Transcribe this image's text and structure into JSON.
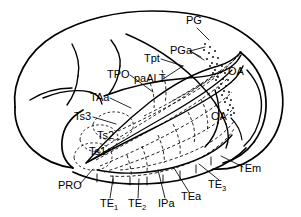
{
  "figure": {
    "kind": "anatomical-line-drawing",
    "width": 301,
    "height": 217,
    "background_color": "#ffffff",
    "ink_color": "#000000"
  },
  "labels": [
    {
      "id": "PG",
      "text": "PG",
      "sub": "",
      "x": 186,
      "y": 24,
      "anchor": "start"
    },
    {
      "id": "PGa",
      "text": "PGa",
      "sub": "",
      "x": 170,
      "y": 54,
      "anchor": "start"
    },
    {
      "id": "Tpt",
      "text": "Tpt",
      "sub": "",
      "x": 144,
      "y": 62,
      "anchor": "start"
    },
    {
      "id": "paALT",
      "text": "paALT",
      "sub": "",
      "x": 134,
      "y": 82,
      "anchor": "start"
    },
    {
      "id": "TPO",
      "text": "TPO",
      "sub": "",
      "x": 107,
      "y": 78,
      "anchor": "start"
    },
    {
      "id": "TAa",
      "text": "TAa",
      "sub": "",
      "x": 90,
      "y": 101,
      "anchor": "start"
    },
    {
      "id": "Ts3",
      "text": "Ts3",
      "sub": "",
      "x": 74,
      "y": 120,
      "anchor": "start"
    },
    {
      "id": "Ts2",
      "text": "Ts2",
      "sub": "",
      "x": 97,
      "y": 139,
      "anchor": "start"
    },
    {
      "id": "Ts1",
      "text": "Ts1",
      "sub": "",
      "x": 89,
      "y": 155,
      "anchor": "start"
    },
    {
      "id": "OA-upper",
      "text": "OA",
      "sub": "",
      "x": 228,
      "y": 75,
      "anchor": "start"
    },
    {
      "id": "OA-lower",
      "text": "OA",
      "sub": "",
      "x": 211,
      "y": 120,
      "anchor": "start"
    },
    {
      "id": "PRO",
      "text": "PRO",
      "sub": "",
      "x": 58,
      "y": 189,
      "anchor": "start"
    },
    {
      "id": "TE1",
      "text": "TE",
      "sub": "1",
      "x": 100,
      "y": 207,
      "anchor": "start"
    },
    {
      "id": "TE2",
      "text": "TE",
      "sub": "2",
      "x": 128,
      "y": 207,
      "anchor": "start"
    },
    {
      "id": "IPa",
      "text": "IPa",
      "sub": "",
      "x": 158,
      "y": 207,
      "anchor": "start"
    },
    {
      "id": "TEa",
      "text": "TEa",
      "sub": "",
      "x": 181,
      "y": 200,
      "anchor": "start"
    },
    {
      "id": "TE3",
      "text": "TE",
      "sub": "3",
      "x": 208,
      "y": 188,
      "anchor": "start"
    },
    {
      "id": "TEm",
      "text": "TEm",
      "sub": "",
      "x": 238,
      "y": 172,
      "anchor": "start"
    }
  ],
  "leaders": [
    {
      "id": "PG",
      "d": "M 197 28 L 209 40"
    },
    {
      "id": "PGa",
      "d": "M 190 51 L 205 47 M 190 51 L 204 60 M 190 51 L 201 57"
    },
    {
      "id": "Tpt",
      "d": "M 161 59 L 183 66"
    },
    {
      "id": "paALT",
      "d": "M 163 79 L 183 66"
    },
    {
      "id": "TPO",
      "d": "M 130 75 L 153 92"
    },
    {
      "id": "TAa",
      "d": "M 110 98 L 131 108"
    },
    {
      "id": "Ts3",
      "d": "M 93 117 L 116 124"
    },
    {
      "id": "PRO",
      "d": "M 80 184 L 93 169"
    },
    {
      "id": "TE1",
      "d": "M 110 198 L 113 179"
    },
    {
      "id": "TE2",
      "d": "M 138 198 L 139 179"
    },
    {
      "id": "IPa",
      "d": "M 165 198 L 158 170"
    },
    {
      "id": "TEa",
      "d": "M 189 192 L 174 168"
    },
    {
      "id": "TE3",
      "d": "M 219 180 L 199 164"
    },
    {
      "id": "TEm",
      "d": "M 243 167 L 221 156"
    }
  ],
  "paths": {
    "cerebrum_outline": "M 15 107 C 12 82 26 52 55 35 C 82 19 118 11 152 11 C 186 11 212 16 233 27 C 253 38 266 51 274 66 C 282 82 285 100 281 118 C 277 136 266 150 252 159 C 240 167 226 170 213 169",
    "frontal_lower": "M 15 107 C 14 123 21 139 33 150 C 44 160 58 166 73 168",
    "arcuate_sulcus": "M 43 98 C 58 92 76 89 90 92 C 97 94 101 98 102 104",
    "principal_sulcus": "M 30 100 C 41 93 57 88 72 88",
    "arc_upper": "M 72 44 C 78 55 80 66 78 76",
    "arc_branch": "M 78 76 C 77 87 73 97 67 105",
    "central_sulcus": "M 111 40 C 118 49 121 58 120 66",
    "central_sulcus_b": "M 120 66 C 119 76 115 86 109 94",
    "sts_top": "M 126 34 C 150 44 175 60 196 80 C 211 95 221 110 226 124",
    "sts_top_b": "M 226 124 C 229 133 229 141 226 148",
    "lat_fissure_upper": "M 104 96 C 130 86 160 80 188 78 C 207 77 222 74 232 66",
    "lat_fissure_upper_b": "M 232 66 C 236 63 239 59 241 55",
    "sts_upper_bank": "M 86 163 C 104 142 126 121 150 102 C 172 85 196 72 218 66 C 228 63 236 58 241 52",
    "sts_lower_bank": "M 86 163 C 106 152 130 140 154 128 C 180 115 206 101 224 88 C 234 81 240 74 243 66",
    "sts_fundus": "M 88 162 C 112 147 140 131 168 115 C 196 99 218 84 232 70",
    "temporal_pole": "M 73 168 C 65 162 61 152 62 141 C 63 128 71 117 83 110",
    "temporal_lower": "M 73 172 C 90 180 112 184 138 184 C 166 184 192 179 212 170",
    "temporal_lower_b": "M 212 170 C 226 164 238 157 246 148",
    "ot_sulcus": "M 97 170 C 126 176 160 173 188 163 C 208 156 223 146 232 135",
    "occipital_notch": "M 240 52 C 253 62 262 76 265 92 C 268 110 264 128 254 142",
    "occipital_notch_b": "M 254 142 C 246 153 235 160 223 163",
    "occipital_inner": "M 247 70 C 258 82 263 97 261 112 C 259 126 253 138 244 146",
    "lunate_sulcus": "M 215 90 C 219 102 220 113 218 123",
    "lunate_sulcus_b": "M 218 123 C 216 133 211 141 205 147",
    "io_sulcus": "M 231 118 C 237 124 241 132 242 140"
  },
  "dashed_paths": [
    "M 96 160 C 118 148 144 134 170 119 C 194 105 214 91 227 79",
    "M 100 166 C 124 156 152 143 178 129 C 202 116 221 103 232 92",
    "M 104 172 C 130 164 158 153 184 141 C 206 131 224 119 234 108",
    "M 92 155 C 112 142 136 127 160 112 C 184 97 205 83 219 71",
    "M 118 131 C 136 123 158 112 180 100 C 200 89 217 77 228 67",
    "M 144 116 C 162 107 184 95 204 83 C 219 74 230 65 236 58",
    "M 172 101 C 188 92 206 81 220 71 C 230 64 238 57 242 52",
    "M 120 170 C 146 168 176 160 200 148 C 216 140 228 130 235 120",
    "M 110 176 C 138 178 170 172 196 160 C 214 151 227 140 234 129",
    "M 201 99 C 207 111 209 122 207 132",
    "M 188 112 C 194 124 196 134 194 143",
    "M 173 124 C 179 136 181 146 180 154",
    "M 158 135 C 163 147 165 156 164 163",
    "M 142 146 C 146 157 148 165 147 171",
    "M 127 155 C 130 165 132 172 131 177",
    "M 162 70 C 166 82 167 93 165 103",
    "M 148 78 C 153 89 155 99 154 108"
  ],
  "ts_contours": [
    "M 80 140 C 80 132 87 126 97 125 C 108 124 117 129 118 137 C 119 145 112 151 102 152 C 91 153 82 148 80 140 Z",
    "M 74 158 C 74 150 81 144 91 143 C 102 142 111 147 112 155 C 113 163 106 169 96 170 C 85 171 76 166 74 158 Z",
    "M 93 124 C 96 116 106 111 117 112 C 128 113 135 120 133 128 C 131 136 121 141 110 140 C 100 139 92 132 93 124 Z"
  ],
  "ticks": [
    "M 97 174 L 97 182",
    "M 113 176 L 113 184",
    "M 130 177 L 130 185",
    "M 147 177 L 147 185",
    "M 163 175 L 163 183",
    "M 180 171 L 180 179",
    "M 196 165 L 196 173",
    "M 211 157 L 211 165"
  ],
  "stipple_points": [
    [
      205,
      44
    ],
    [
      210,
      47
    ],
    [
      215,
      51
    ],
    [
      209,
      53
    ],
    [
      204,
      50
    ],
    [
      213,
      57
    ],
    [
      218,
      58
    ],
    [
      207,
      59
    ],
    [
      212,
      63
    ],
    [
      217,
      64
    ],
    [
      222,
      66
    ],
    [
      210,
      66
    ],
    [
      215,
      70
    ],
    [
      220,
      72
    ],
    [
      225,
      73
    ],
    [
      213,
      73
    ],
    [
      218,
      77
    ],
    [
      223,
      79
    ],
    [
      228,
      80
    ],
    [
      216,
      80
    ],
    [
      221,
      84
    ],
    [
      226,
      86
    ],
    [
      219,
      88
    ],
    [
      224,
      91
    ],
    [
      229,
      92
    ],
    [
      222,
      95
    ],
    [
      227,
      98
    ],
    [
      231,
      100
    ],
    [
      225,
      102
    ],
    [
      230,
      105
    ],
    [
      228,
      110
    ],
    [
      233,
      108
    ],
    [
      231,
      115
    ],
    [
      234,
      113
    ]
  ]
}
